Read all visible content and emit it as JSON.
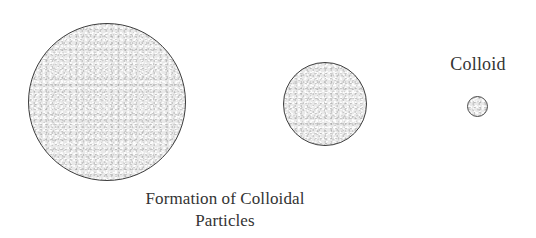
{
  "figure": {
    "background_color": "#ffffff",
    "particles": [
      {
        "name": "large-particle",
        "role": "bulk-particle",
        "diameter_px": 158,
        "center_x": 107,
        "center_y": 102,
        "fill_color": "#e9e9e9",
        "stroke_color": "#3d3d3d"
      },
      {
        "name": "medium-particle",
        "role": "intermediate-particle",
        "diameter_px": 84,
        "center_x": 325,
        "center_y": 104,
        "fill_color": "#e9e9e9",
        "stroke_color": "#3d3d3d"
      },
      {
        "name": "small-particle",
        "role": "colloid-particle",
        "diameter_px": 21,
        "center_x": 477,
        "center_y": 106,
        "fill_color": "#e9e9e9",
        "stroke_color": "#4a4a4a"
      }
    ],
    "colloid_label": "Colloid",
    "caption_lines": [
      "Formation of Colloidal",
      "Particles"
    ],
    "caption_full": "Formation of Colloidal Particles",
    "text_color": "#333333"
  }
}
